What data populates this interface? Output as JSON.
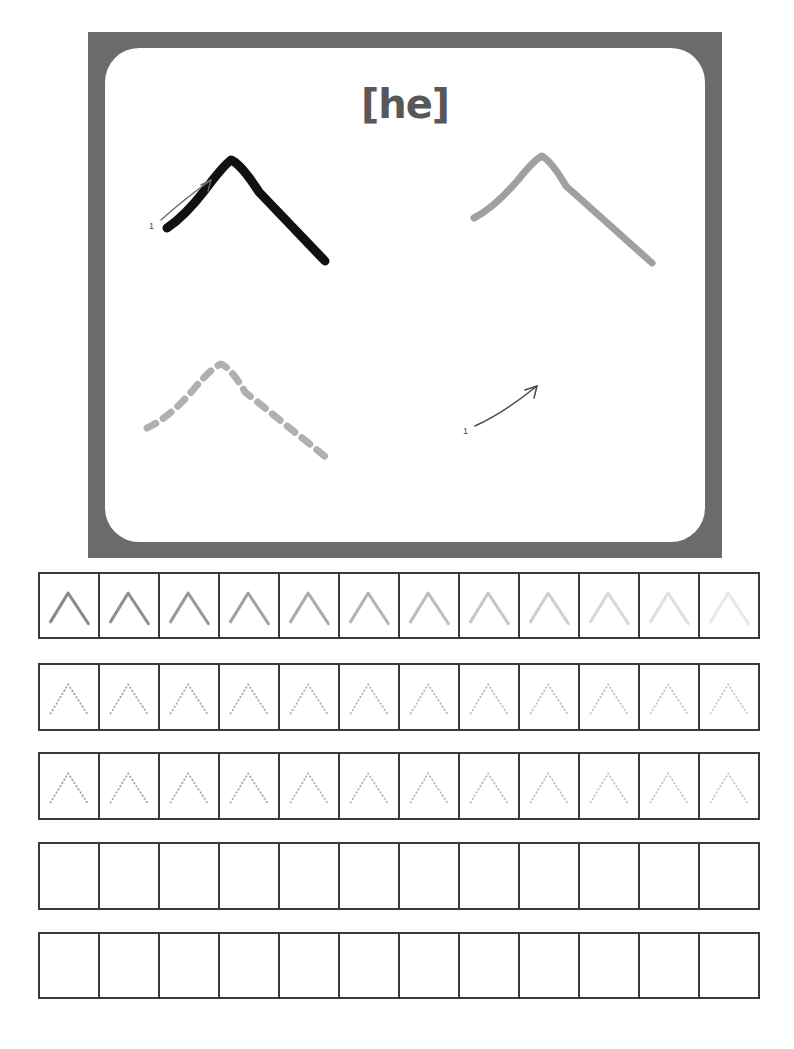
{
  "worksheet": {
    "type": "handwriting-tracing-worksheet",
    "page_width": 794,
    "page_height": 1049,
    "background_color": "#ffffff"
  },
  "demo_box": {
    "title": "[he]",
    "title_color": "#58585a",
    "frame_color": "#6b6b6b",
    "inner_background": "#ffffff",
    "examples": [
      {
        "position": "top-left",
        "name": "solid-dark-example",
        "style": "solid",
        "color": "#111111",
        "stroke_width": 9,
        "has_arrow": true,
        "stroke_number": "1"
      },
      {
        "position": "top-right",
        "name": "solid-gray-example",
        "style": "solid",
        "color": "#a0a0a0",
        "stroke_width": 7,
        "has_arrow": false,
        "stroke_number": ""
      },
      {
        "position": "bottom-left",
        "name": "dashed-gray-example",
        "style": "dashed",
        "color": "#b0b0b0",
        "stroke_width": 7,
        "has_arrow": false,
        "stroke_number": ""
      },
      {
        "position": "bottom-right",
        "name": "arrow-only-example",
        "style": "none",
        "color": "#4a4a4a",
        "stroke_width": 0,
        "has_arrow": true,
        "stroke_number": "1"
      }
    ]
  },
  "practice_rows": [
    {
      "index": 1,
      "name": "row-solid-fade",
      "style": "solid",
      "cells": 12,
      "top": 572,
      "height": 67,
      "colors": [
        "#8a8a8a",
        "#909090",
        "#999999",
        "#a2a2a2",
        "#ababab",
        "#b4b4b4",
        "#bdbdbd",
        "#c6c6c6",
        "#cfcfcf",
        "#d8d8d8",
        "#e0e0e0",
        "#e8e8e8"
      ]
    },
    {
      "index": 2,
      "name": "row-dotted-a",
      "style": "dotted",
      "cells": 12,
      "top": 663,
      "height": 68,
      "colors": [
        "#9e9e9e",
        "#a2a2a2",
        "#a6a6a6",
        "#aaaaaa",
        "#aeaeae",
        "#b2b2b2",
        "#b5b5b5",
        "#b8b8b8",
        "#bbbbbb",
        "#bebebe",
        "#c1c1c1",
        "#c4c4c4"
      ]
    },
    {
      "index": 3,
      "name": "row-dotted-b",
      "style": "dotted",
      "cells": 12,
      "top": 752,
      "height": 68,
      "colors": [
        "#9e9e9e",
        "#a2a2a2",
        "#a6a6a6",
        "#aaaaaa",
        "#aeaeae",
        "#b2b2b2",
        "#b5b5b5",
        "#b8b8b8",
        "#bbbbbb",
        "#bebebe",
        "#c1c1c1",
        "#c4c4c4"
      ]
    },
    {
      "index": 4,
      "name": "row-blank-a",
      "style": "blank",
      "cells": 12,
      "top": 842,
      "height": 68,
      "colors": []
    },
    {
      "index": 5,
      "name": "row-blank-b",
      "style": "blank",
      "cells": 12,
      "top": 932,
      "height": 67,
      "colors": []
    }
  ],
  "glyph": {
    "character": "he",
    "shape": "caret",
    "path": "M 12 50 L 32 20 L 55 52",
    "viewbox": "0 0 66 66"
  }
}
